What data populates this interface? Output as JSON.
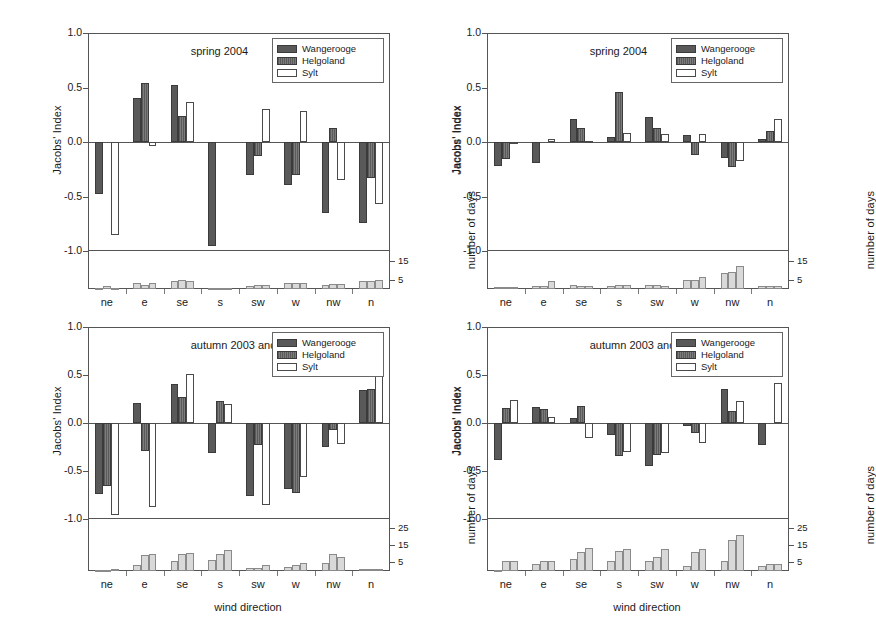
{
  "figure": {
    "categories": [
      "ne",
      "e",
      "se",
      "s",
      "sw",
      "w",
      "nw",
      "n"
    ],
    "series_names": [
      "Wangerooge",
      "Helgoland",
      "Sylt"
    ],
    "colors": {
      "wangerooge": "#595959",
      "helgoland": "#6f6f6f",
      "sylt": "#ffffff",
      "days": "#d9d9d9",
      "axis": "#555555"
    },
    "axis_titles": {
      "y_left": "Jacobs' Index",
      "y_right": "Jacobs' Index",
      "y_days": "number of days",
      "x": "wind direction"
    },
    "y_ticks": [
      "1.0",
      "0.5",
      "0.0",
      "-0.5",
      "-1.0"
    ],
    "y_tick_values": [
      1.0,
      0.5,
      0.0,
      -0.5,
      -1.0
    ],
    "days_ticks_short": [
      "15",
      "5"
    ],
    "days_tick_values_short": [
      15,
      5
    ],
    "days_ticks_tall": [
      "25",
      "15",
      "5"
    ],
    "days_tick_values_tall": [
      25,
      15,
      5
    ]
  },
  "chart_data": [
    {
      "id": "top-left",
      "type": "bar",
      "title": "spring 2004",
      "xlabel": "",
      "ylabel": "Jacobs' Index",
      "ylim": [
        -1.0,
        1.0
      ],
      "categories": [
        "ne",
        "e",
        "se",
        "s",
        "sw",
        "w",
        "nw",
        "n"
      ],
      "legend": [
        "Wangerooge",
        "Helgoland",
        "Sylt"
      ],
      "legend_position": "top-right",
      "grid": true,
      "series": [
        {
          "name": "Wangerooge",
          "values": [
            -0.48,
            0.4,
            0.52,
            -0.95,
            -0.3,
            -0.39,
            -0.65,
            -0.74
          ]
        },
        {
          "name": "Helgoland",
          "values": [
            0.0,
            0.54,
            0.24,
            0.0,
            -0.13,
            -0.3,
            0.13,
            -0.33
          ]
        },
        {
          "name": "Sylt",
          "values": [
            -0.85,
            -0.04,
            0.37,
            0.0,
            0.3,
            0.28,
            -0.35,
            -0.57
          ]
        }
      ],
      "secondary": {
        "name": "number of days",
        "ylim": [
          0,
          20
        ],
        "ticks": [
          15,
          5
        ],
        "series": [
          {
            "name": "Wangerooge",
            "values": [
              0.4,
              3.0,
              4.0,
              0.4,
              1.8,
              3.2,
              2.0,
              4.0
            ]
          },
          {
            "name": "Helgoland",
            "values": [
              1.6,
              2.0,
              5.0,
              0.3,
              2.0,
              3.0,
              2.4,
              4.4
            ]
          },
          {
            "name": "Sylt",
            "values": [
              0.4,
              3.0,
              4.2,
              0.3,
              2.0,
              3.0,
              2.4,
              5.0
            ]
          }
        ]
      }
    },
    {
      "id": "top-right",
      "type": "bar",
      "title": "spring 2004",
      "xlabel": "",
      "ylabel": "Jacobs' Index",
      "ylim": [
        -1.0,
        1.0
      ],
      "categories": [
        "ne",
        "e",
        "se",
        "s",
        "sw",
        "w",
        "nw",
        "n"
      ],
      "legend": [
        "Wangerooge",
        "Helgoland",
        "Sylt"
      ],
      "legend_position": "top-right",
      "grid": true,
      "series": [
        {
          "name": "Wangerooge",
          "values": [
            -0.22,
            -0.19,
            0.21,
            0.05,
            0.23,
            0.06,
            -0.15,
            0.03
          ]
        },
        {
          "name": "Helgoland",
          "values": [
            -0.16,
            0.0,
            0.13,
            0.46,
            0.13,
            -0.12,
            -0.23,
            0.1
          ]
        },
        {
          "name": "Sylt",
          "values": [
            -0.01,
            0.03,
            0.01,
            0.08,
            0.07,
            0.07,
            -0.17,
            0.21
          ]
        }
      ],
      "secondary": {
        "name": "number of days",
        "ylim": [
          0,
          20
        ],
        "ticks": [
          15,
          5
        ],
        "series": [
          {
            "name": "Wangerooge",
            "values": [
              1.2,
              1.6,
              2.2,
              1.6,
              2.0,
              5.0,
              8.5,
              1.6
            ]
          },
          {
            "name": "Helgoland",
            "values": [
              1.2,
              1.6,
              1.8,
              2.2,
              2.2,
              5.0,
              9.0,
              1.6
            ]
          },
          {
            "name": "Sylt",
            "values": [
              1.2,
              4.0,
              1.8,
              2.2,
              1.6,
              6.5,
              12.0,
              1.6
            ]
          }
        ]
      }
    },
    {
      "id": "bottom-left",
      "type": "bar",
      "title": "autumn 2003 and 2004",
      "xlabel": "wind direction",
      "ylabel": "Jacobs' Index",
      "ylim": [
        -1.0,
        1.0
      ],
      "categories": [
        "ne",
        "e",
        "se",
        "s",
        "sw",
        "w",
        "nw",
        "n"
      ],
      "legend": [
        "Wangerooge",
        "Helgoland",
        "Sylt"
      ],
      "legend_position": "top-right",
      "grid": true,
      "series": [
        {
          "name": "Wangerooge",
          "values": [
            -0.74,
            0.21,
            0.41,
            -0.31,
            -0.76,
            -0.69,
            -0.25,
            0.34
          ]
        },
        {
          "name": "Helgoland",
          "values": [
            -0.66,
            -0.29,
            0.27,
            0.23,
            -0.23,
            -0.73,
            -0.07,
            0.35
          ]
        },
        {
          "name": "Sylt",
          "values": [
            -0.96,
            -0.88,
            0.51,
            0.2,
            -0.85,
            -0.56,
            -0.22,
            0.51
          ]
        }
      ],
      "secondary": {
        "name": "number of days",
        "ylim": [
          0,
          30
        ],
        "ticks": [
          25,
          15,
          5
        ],
        "series": [
          {
            "name": "Wangerooge",
            "values": [
              0.5,
              3.5,
              6.0,
              6.5,
              1.5,
              2.5,
              4.5,
              1.0
            ]
          },
          {
            "name": "Helgoland",
            "values": [
              0.8,
              9.0,
              10.0,
              10.0,
              2.0,
              3.5,
              10.0,
              1.2
            ]
          },
          {
            "name": "Sylt",
            "values": [
              1.0,
              10.0,
              10.5,
              12.0,
              3.5,
              4.5,
              8.0,
              1.2
            ]
          }
        ]
      }
    },
    {
      "id": "bottom-right",
      "type": "bar",
      "title": "autumn 2003 and 2004",
      "xlabel": "wind direction",
      "ylabel": "Jacobs' Index",
      "ylim": [
        -1.0,
        1.0
      ],
      "categories": [
        "ne",
        "e",
        "se",
        "s",
        "sw",
        "w",
        "nw",
        "n"
      ],
      "legend": [
        "Wangerooge",
        "Helgoland",
        "Sylt"
      ],
      "legend_position": "top-right",
      "grid": true,
      "series": [
        {
          "name": "Wangerooge",
          "values": [
            -0.39,
            0.17,
            0.05,
            -0.12,
            -0.45,
            -0.03,
            0.35,
            -0.23
          ]
        },
        {
          "name": "Helgoland",
          "values": [
            0.16,
            0.15,
            0.18,
            -0.34,
            -0.33,
            -0.1,
            0.12,
            0.0
          ]
        },
        {
          "name": "Sylt",
          "values": [
            0.24,
            0.06,
            -0.16,
            -0.3,
            -0.31,
            -0.21,
            0.23,
            0.42
          ]
        }
      ],
      "secondary": {
        "name": "number of days",
        "ylim": [
          0,
          30
        ],
        "ticks": [
          25,
          15,
          5
        ],
        "series": [
          {
            "name": "Wangerooge",
            "values": [
              0.4,
              4.0,
              7.0,
              5.5,
              6.0,
              3.0,
              6.0,
              3.0
            ]
          },
          {
            "name": "Helgoland",
            "values": [
              6.0,
              5.5,
              11.0,
              11.5,
              8.0,
              11.0,
              18.0,
              4.0
            ]
          },
          {
            "name": "Sylt",
            "values": [
              6.0,
              5.5,
              13.0,
              12.5,
              12.5,
              12.5,
              21.0,
              4.0
            ]
          }
        ]
      }
    }
  ]
}
